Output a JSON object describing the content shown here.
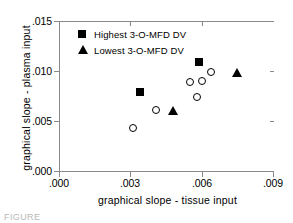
{
  "chart_data": {
    "type": "scatter",
    "title": "",
    "xlabel": "graphical  slope  -  tissue  input",
    "ylabel": "graphical  slope  -  plasma  input",
    "xlim": [
      0.0,
      0.009
    ],
    "ylim": [
      0.0,
      0.015
    ],
    "xticks": [
      0.0,
      0.003,
      0.006,
      0.009
    ],
    "yticks": [
      0.0,
      0.005,
      0.01,
      0.015
    ],
    "xticklabels": [
      ".000",
      ".003",
      ".006",
      ".009"
    ],
    "yticklabels": [
      ".000",
      ".005",
      ".010",
      ".015"
    ],
    "grid": false,
    "legend_position": "upper-left-inside",
    "series": [
      {
        "name": "Highest 3-O-MFD DV",
        "marker": "filled-square",
        "color": "#000000",
        "points": [
          {
            "x": 0.0034,
            "y": 0.0079
          },
          {
            "x": 0.0059,
            "y": 0.0109
          }
        ]
      },
      {
        "name": "Lowest 3-O-MFD DV",
        "marker": "filled-triangle",
        "color": "#000000",
        "points": [
          {
            "x": 0.0048,
            "y": 0.006
          },
          {
            "x": 0.0075,
            "y": 0.0098
          }
        ]
      },
      {
        "name": "Other subjects",
        "marker": "open-circle",
        "color": "#000000",
        "points": [
          {
            "x": 0.0031,
            "y": 0.0043
          },
          {
            "x": 0.0041,
            "y": 0.0061
          },
          {
            "x": 0.0055,
            "y": 0.0089
          },
          {
            "x": 0.0058,
            "y": 0.0074
          },
          {
            "x": 0.006,
            "y": 0.009
          },
          {
            "x": 0.0064,
            "y": 0.0099
          }
        ]
      }
    ]
  },
  "legend": {
    "items": [
      {
        "label": "Highest  3-O-MFD  DV",
        "marker": "filled-square"
      },
      {
        "label": "Lowest  3-O-MFD  DV",
        "marker": "filled-triangle"
      }
    ]
  },
  "caption_scrap": "FIGURE"
}
